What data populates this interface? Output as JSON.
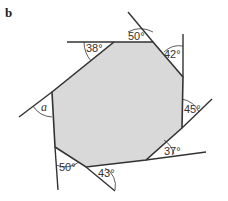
{
  "part_label": "b",
  "colors": {
    "fill": "#d9d9d9",
    "stroke": "#333333"
  },
  "polygon": {
    "vertices": [
      [
        114,
        42
      ],
      [
        153,
        42
      ],
      [
        183,
        77
      ],
      [
        182,
        128
      ],
      [
        146,
        160
      ],
      [
        86,
        167
      ],
      [
        55,
        147
      ],
      [
        52,
        92
      ]
    ]
  },
  "exterior_angles": [
    {
      "label": "38°"
    },
    {
      "label": "50°"
    },
    {
      "label": "42°"
    },
    {
      "label": "45°"
    },
    {
      "label": "37°"
    },
    {
      "label": "43°"
    },
    {
      "label": "50°"
    },
    {
      "label": "a"
    }
  ]
}
